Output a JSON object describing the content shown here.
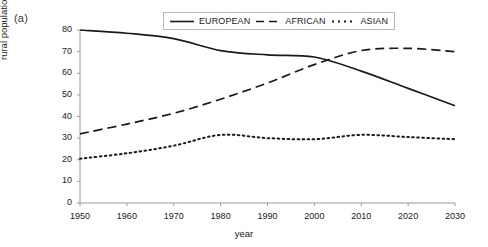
{
  "figure": {
    "panel_label": "(a)"
  },
  "legend": {
    "position": "top-center",
    "entries": [
      {
        "label": "EUROPEAN",
        "style": "solid"
      },
      {
        "label": "AFRICAN",
        "style": "dashed"
      },
      {
        "label": "ASIAN",
        "style": "dotted"
      }
    ]
  },
  "axes": {
    "xlabel": "year",
    "ylabel": "rural population  millions",
    "xticks": [
      "1950",
      "1960",
      "1970",
      "1980",
      "1990",
      "2000",
      "2010",
      "2020",
      "2030"
    ],
    "yticks": [
      "0",
      "10",
      "20",
      "30",
      "40",
      "50",
      "60",
      "70",
      "80"
    ]
  },
  "chart_data": {
    "type": "line",
    "title": "",
    "xlabel": "year",
    "ylabel": "rural population millions",
    "xlim": [
      1950,
      2030
    ],
    "ylim": [
      0,
      80
    ],
    "grid": false,
    "legend_position": "top-center",
    "x": [
      1950,
      1960,
      1970,
      1980,
      1990,
      2000,
      2010,
      2020,
      2030
    ],
    "series": [
      {
        "name": "EUROPEAN",
        "style": "solid",
        "color": "#1a1a1a",
        "values": [
          80.0,
          78.5,
          76.0,
          70.5,
          68.5,
          67.5,
          61.0,
          53.0,
          45.0
        ]
      },
      {
        "name": "AFRICAN",
        "style": "dashed",
        "color": "#1a1a1a",
        "values": [
          32.0,
          36.5,
          41.5,
          48.0,
          55.5,
          64.0,
          70.5,
          71.5,
          70.0
        ]
      },
      {
        "name": "ASIAN",
        "style": "dotted",
        "color": "#1a1a1a",
        "values": [
          20.5,
          23.0,
          26.5,
          31.5,
          30.0,
          29.5,
          31.5,
          30.5,
          29.5
        ]
      }
    ]
  }
}
